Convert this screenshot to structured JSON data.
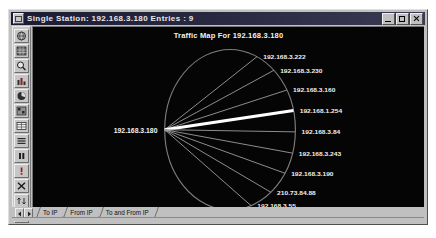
{
  "window": {
    "title": "Single Station: 192.168.3.180    Entries : 9",
    "sysmenu_icon": "system-menu-icon",
    "controls": {
      "minimize": "minimize-icon",
      "maximize": "maximize-icon",
      "close": "close-icon"
    }
  },
  "toolbar": {
    "items": [
      {
        "name": "globe-icon",
        "glyph": "◎"
      },
      {
        "name": "grid-icon",
        "glyph": "▒"
      },
      {
        "name": "magnifier-icon",
        "glyph": "⚲"
      },
      {
        "name": "bar-chart-icon",
        "glyph": "█"
      },
      {
        "name": "pie-chart-icon",
        "glyph": "◕"
      },
      {
        "name": "matrix-icon",
        "glyph": "░"
      },
      {
        "name": "table-icon",
        "glyph": "⊞"
      },
      {
        "name": "list-icon",
        "glyph": "≣"
      },
      {
        "name": "pause-icon",
        "glyph": "‖"
      },
      {
        "name": "alert-icon",
        "glyph": "!"
      },
      {
        "name": "stop-icon",
        "glyph": "✕"
      },
      {
        "name": "sort-icon",
        "glyph": "⇅"
      },
      {
        "name": "copy-icon",
        "glyph": "⧉"
      }
    ]
  },
  "chart": {
    "title": "Traffic Map For 192.168.3.180",
    "center_node": "192.168.3.180",
    "background": "#050505",
    "spoke_color": "#9a9a9a",
    "highlight_color": "#ffffff",
    "circle_color": "#8e8e8e"
  },
  "chart_data": {
    "type": "scatter",
    "title": "Traffic Map For 192.168.3.180",
    "xlabel": "",
    "ylabel": "",
    "center": "192.168.3.180",
    "categories": [
      "192.168.3.222",
      "192.168.3.230",
      "192.168.3.160",
      "192.168.1.254",
      "192.168.3.84",
      "192.168.3.243",
      "192.168.3.190",
      "210.73.84.88",
      "192.168.3.55"
    ],
    "values": [
      1,
      1,
      1,
      6,
      1,
      1,
      1,
      1,
      1
    ],
    "series": [
      {
        "name": "spoke-weight",
        "values": [
          1,
          1,
          1,
          6,
          1,
          1,
          1,
          1,
          1
        ]
      }
    ],
    "nodes": [
      {
        "label": "192.168.3.222",
        "angle_deg": -40,
        "weight": 1,
        "highlight": false
      },
      {
        "label": "192.168.3.230",
        "angle_deg": -30,
        "weight": 1,
        "highlight": false
      },
      {
        "label": "192.168.3.160",
        "angle_deg": -19,
        "weight": 1,
        "highlight": false
      },
      {
        "label": "192.168.1.254",
        "angle_deg": -9,
        "weight": 6,
        "highlight": true
      },
      {
        "label": "192.168.3.84",
        "angle_deg": 1,
        "weight": 1,
        "highlight": false
      },
      {
        "label": "192.168.3.243",
        "angle_deg": 11,
        "weight": 1,
        "highlight": false
      },
      {
        "label": "192.168.3.190",
        "angle_deg": 21,
        "weight": 1,
        "highlight": false
      },
      {
        "label": "210.73.84.88",
        "angle_deg": 32,
        "weight": 1,
        "highlight": false
      },
      {
        "label": "192.168.3.55",
        "angle_deg": 43,
        "weight": 1,
        "highlight": false
      }
    ],
    "legend": [],
    "grid": false
  },
  "tabbar": {
    "nav_first": "nav-prev-icon",
    "nav_last": "nav-next-icon",
    "tabs": [
      {
        "label": "To IP",
        "active": true
      },
      {
        "label": "From IP",
        "active": false
      },
      {
        "label": "To and From IP",
        "active": false
      }
    ]
  }
}
